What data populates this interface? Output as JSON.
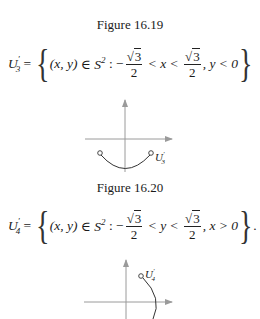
{
  "figures": [
    {
      "caption": "Figure 16.19",
      "equation": {
        "lhs": "U",
        "lhs_prime": "′",
        "lhs_sub": "3",
        "eq": " = ",
        "open_brace": "{",
        "pair": "(x, y)",
        "in": " ∈ ",
        "set": "S",
        "set_sup": "2",
        "colon": " : −",
        "frac_num": "3",
        "frac_den": "2",
        "cond_var": " < x < ",
        "frac2_num": "3",
        "frac2_den": "2",
        "tail": ", y < 0",
        "close_brace": "}",
        "end": ""
      },
      "diagram": {
        "label": "U",
        "label_prime": "′",
        "label_sub": "3"
      }
    },
    {
      "caption": "Figure 16.20",
      "equation": {
        "lhs": "U",
        "lhs_prime": "′",
        "lhs_sub": "4",
        "eq": " = ",
        "open_brace": "{",
        "pair": "(x, y)",
        "in": " ∈ ",
        "set": "S",
        "set_sup": "2",
        "colon": " : −",
        "frac_num": "3",
        "frac_den": "2",
        "cond_var": " < y < ",
        "frac2_num": "3",
        "frac2_den": "2",
        "tail": ", x > 0",
        "close_brace": "}",
        "end": "."
      },
      "diagram": {
        "label": "U",
        "label_prime": "′",
        "label_sub": "4"
      }
    }
  ],
  "colors": {
    "axis": "#9a9a9a",
    "curve": "#333333",
    "text": "#1a1a1a"
  }
}
